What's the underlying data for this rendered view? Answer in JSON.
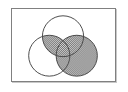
{
  "figure": {
    "type": "venn-diagram",
    "set_count": 3,
    "caption": "",
    "frame": {
      "border_color": "#808080",
      "border_width_px": 1,
      "shadow_color": "#c8c8c8",
      "background_color": "#ffffff",
      "x": 11,
      "y": 8,
      "width": 105,
      "height": 74
    },
    "style": {
      "outline_color": "#4a4a4a",
      "outline_width_px": 1,
      "fill_unshaded_color": "#ffffff",
      "fill_shaded_color": "#808080",
      "shading_pattern": "checkerboard-dither-50",
      "shading_dot_color": "#6e6e6e",
      "shading_gap_color": "#d4d4d4"
    },
    "circles": [
      {
        "id": "top",
        "label": "",
        "cx": 52,
        "cy": 28,
        "r": 21,
        "shaded": false
      },
      {
        "id": "left",
        "label": "",
        "cx": 38,
        "cy": 48,
        "r": 21,
        "shaded": false
      },
      {
        "id": "right",
        "label": "",
        "cx": 66,
        "cy": 48,
        "r": 21,
        "shaded": true
      }
    ],
    "shaded_regions": [
      "right",
      "top-and-left",
      "top-and-right",
      "left-and-right",
      "top-and-left-and-right"
    ],
    "unshaded_regions": [
      "top-only",
      "left-only"
    ]
  }
}
